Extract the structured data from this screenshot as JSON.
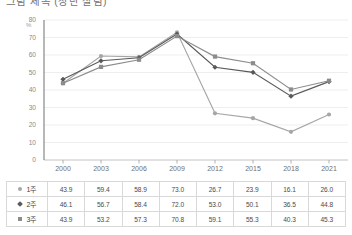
{
  "title": "그림 제목 (상단 잘림)",
  "axis": {
    "y_unit": "%",
    "y_ticks": [
      80,
      70,
      60,
      50,
      40,
      30,
      20,
      10,
      0
    ],
    "x_ticks": [
      "2000",
      "2003",
      "2006",
      "2009",
      "2012",
      "2015",
      "2018",
      "2021"
    ]
  },
  "legend": [
    {
      "marker": "circle-marker",
      "label": "1주",
      "color": "#a6a6a6"
    },
    {
      "marker": "diamond-marker",
      "label": "2주",
      "color": "#595959"
    },
    {
      "marker": "square-marker",
      "label": "3주",
      "color": "#8c8c8c"
    }
  ],
  "table": {
    "rows": [
      {
        "label": "1주",
        "marker": "circle-marker",
        "values": [
          "43.9",
          "59.4",
          "58.9",
          "73.0",
          "26.7",
          "23.9",
          "16.1",
          "26.0"
        ]
      },
      {
        "label": "2주",
        "marker": "diamond-marker",
        "values": [
          "46.1",
          "56.7",
          "58.4",
          "72.0",
          "53.0",
          "50.1",
          "36.5",
          "44.8"
        ]
      },
      {
        "label": "3주",
        "marker": "square-marker",
        "values": [
          "43.9",
          "53.2",
          "57.3",
          "70.8",
          "59.1",
          "55.3",
          "40.3",
          "45.3"
        ]
      }
    ]
  },
  "chart_data": {
    "type": "line",
    "title": "",
    "xlabel": "",
    "ylabel": "%",
    "ylim": [
      0,
      80
    ],
    "ytick_step": 10,
    "grid": "horizontal",
    "legend_position": "bottom-table",
    "categories": [
      "2000",
      "2003",
      "2006",
      "2009",
      "2012",
      "2015",
      "2018",
      "2021"
    ],
    "series": [
      {
        "name": "1주",
        "marker": "circle",
        "color": "#a6a6a6",
        "values": [
          43.9,
          59.4,
          58.9,
          73.0,
          26.7,
          23.9,
          16.1,
          26.0
        ]
      },
      {
        "name": "2주",
        "marker": "diamond",
        "color": "#595959",
        "values": [
          46.1,
          56.7,
          58.4,
          72.0,
          53.0,
          50.1,
          36.5,
          44.8
        ]
      },
      {
        "name": "3주",
        "marker": "square",
        "color": "#8c8c8c",
        "values": [
          43.9,
          53.2,
          57.3,
          70.8,
          59.1,
          55.3,
          40.3,
          45.3
        ]
      }
    ]
  }
}
